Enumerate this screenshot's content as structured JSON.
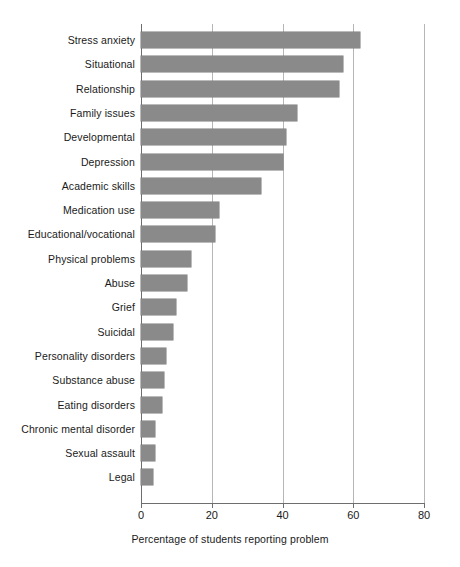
{
  "chart_data": {
    "type": "bar",
    "orientation": "horizontal",
    "title": "",
    "xlabel": "Percentage of students reporting problem",
    "ylabel": "",
    "xlim": [
      0,
      80
    ],
    "xticks": [
      0,
      20,
      40,
      60,
      80
    ],
    "grid": true,
    "legend": false,
    "bar_color": "#8a8a8a",
    "categories": [
      "Stress anxiety",
      "Situational",
      "Relationship",
      "Family issues",
      "Developmental",
      "Depression",
      "Academic skills",
      "Medication use",
      "Educational/vocational",
      "Physical problems",
      "Abuse",
      "Grief",
      "Suicidal",
      "Personality disorders",
      "Substance abuse",
      "Eating disorders",
      "Chronic mental disorder",
      "Sexual assault",
      "Legal"
    ],
    "values": [
      62,
      57,
      56,
      44,
      41,
      40,
      34,
      22,
      21,
      14,
      13,
      10,
      9,
      7,
      6.5,
      6,
      4,
      4,
      3.5
    ]
  }
}
